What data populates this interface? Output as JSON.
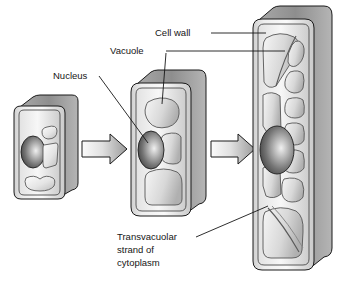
{
  "figure": {
    "background": "#ffffff",
    "line_color": "#1a1a1a",
    "cell_fill_light": "#f2f2f2",
    "cell_fill_mid": "#d2d2d2",
    "cell_fill_dark": "#8f8f8f",
    "nucleus_dark": "#3c3c3c",
    "nucleus_light": "#e6e6e6"
  },
  "labels": {
    "cell_wall": "Cell wall",
    "vacuole": "Vacuole",
    "nucleus": "Nucleus",
    "transvacuolar_line1": "Transvacuolar",
    "transvacuolar_line2": "strand of",
    "transvacuolar_line3": "cytoplasm"
  },
  "stages": [
    {
      "id": "stage-1",
      "name": "young-cell",
      "description": "Small young cell with nucleus and several small vacuoles",
      "vacuole_count": 3
    },
    {
      "id": "stage-2",
      "name": "expanding-cell",
      "description": "Elongating cell with enlarged vacuoles",
      "vacuole_count": 3
    },
    {
      "id": "stage-3",
      "name": "mature-cell",
      "description": "Mature elongated cell with large central vacuole and transvacuolar strands",
      "vacuole_count": 9
    }
  ],
  "arrows": [
    {
      "id": "arrow-1",
      "from": "stage-1",
      "to": "stage-2"
    },
    {
      "id": "arrow-2",
      "from": "stage-2",
      "to": "stage-3"
    }
  ]
}
